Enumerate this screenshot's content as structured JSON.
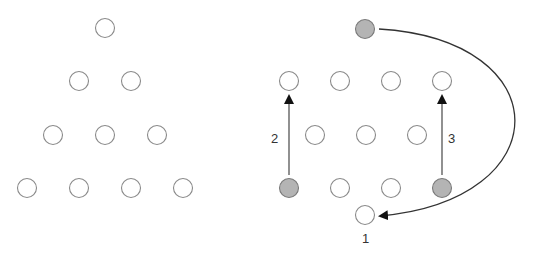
{
  "figure": {
    "colors": {
      "empty_fill": "#ffffff",
      "empty_stroke": "#8a8a8a",
      "filled_fill": "#b4b4b4",
      "arrow": "#333333"
    },
    "left_triangle": {
      "rows": [
        [
          {
            "x": 105,
            "y": 28
          }
        ],
        [
          {
            "x": 79,
            "y": 81
          },
          {
            "x": 131,
            "y": 81
          }
        ],
        [
          {
            "x": 53,
            "y": 135
          },
          {
            "x": 105,
            "y": 135
          },
          {
            "x": 157,
            "y": 135
          }
        ],
        [
          {
            "x": 27,
            "y": 188
          },
          {
            "x": 79,
            "y": 188
          },
          {
            "x": 131,
            "y": 188
          },
          {
            "x": 183,
            "y": 188
          }
        ]
      ]
    },
    "right_diagram": {
      "coins": [
        {
          "x": 365,
          "y": 29,
          "filled": true
        },
        {
          "x": 289,
          "y": 81,
          "filled": false
        },
        {
          "x": 340,
          "y": 81,
          "filled": false
        },
        {
          "x": 391,
          "y": 81,
          "filled": false
        },
        {
          "x": 442,
          "y": 81,
          "filled": false
        },
        {
          "x": 315,
          "y": 135,
          "filled": false
        },
        {
          "x": 366,
          "y": 135,
          "filled": false
        },
        {
          "x": 417,
          "y": 135,
          "filled": false
        },
        {
          "x": 289,
          "y": 188,
          "filled": true
        },
        {
          "x": 340,
          "y": 188,
          "filled": false
        },
        {
          "x": 391,
          "y": 188,
          "filled": false
        },
        {
          "x": 442,
          "y": 188,
          "filled": true
        },
        {
          "x": 365,
          "y": 215,
          "filled": false
        }
      ],
      "moves": [
        {
          "label": "1",
          "from": "top",
          "to": "bottom-center"
        },
        {
          "label": "2",
          "from": "bottom-left",
          "to": "row2-left"
        },
        {
          "label": "3",
          "from": "bottom-right",
          "to": "row2-right"
        }
      ]
    }
  }
}
